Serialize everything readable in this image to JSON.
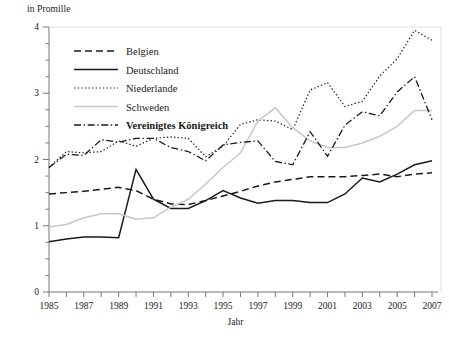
{
  "chart_data": {
    "type": "line",
    "title": "",
    "ylabel": "in Promille",
    "xlabel": "Jahr",
    "ylim": [
      0,
      4
    ],
    "ytick_labels": [
      "0",
      "1",
      "2",
      "3",
      "4"
    ],
    "ytick_values": [
      0,
      1,
      2,
      3,
      4
    ],
    "yminor_step": 0.25,
    "grid": false,
    "legend_position": "upper-left-inside",
    "xlim": [
      1985,
      2007
    ],
    "x": [
      1985,
      1986,
      1987,
      1988,
      1989,
      1990,
      1991,
      1992,
      1993,
      1994,
      1995,
      1996,
      1997,
      1998,
      1999,
      2000,
      2001,
      2002,
      2003,
      2004,
      2005,
      2006,
      2007
    ],
    "xtick_values": [
      1985,
      1986,
      1987,
      1988,
      1989,
      1990,
      1991,
      1992,
      1993,
      1994,
      1995,
      1996,
      1997,
      1998,
      1999,
      2000,
      2001,
      2002,
      2003,
      2004,
      2005,
      2006,
      2007
    ],
    "xtick_labels": [
      "1985",
      "",
      "1987",
      "",
      "1989",
      "",
      "1991",
      "",
      "1993",
      "",
      "1995",
      "",
      "1997",
      "",
      "1999",
      "",
      "2001",
      "",
      "2003",
      "",
      "2005",
      "",
      "2007"
    ],
    "series": [
      {
        "name": "Belgien",
        "style": "dashed",
        "color": "#1a1a1a",
        "values": [
          1.48,
          1.5,
          1.52,
          1.55,
          1.58,
          1.53,
          1.4,
          1.33,
          1.32,
          1.38,
          1.45,
          1.52,
          1.6,
          1.66,
          1.7,
          1.74,
          1.74,
          1.74,
          1.76,
          1.78,
          1.74,
          1.78,
          1.8
        ]
      },
      {
        "name": "Deutschland",
        "style": "solid",
        "color": "#1a1a1a",
        "values": [
          0.76,
          0.8,
          0.83,
          0.83,
          0.82,
          1.85,
          1.4,
          1.26,
          1.26,
          1.38,
          1.53,
          1.42,
          1.34,
          1.38,
          1.38,
          1.35,
          1.35,
          1.48,
          1.72,
          1.66,
          1.78,
          1.92,
          1.98
        ]
      },
      {
        "name": "Niederlande",
        "style": "dotted",
        "color": "#1a1a1a",
        "values": [
          1.88,
          2.12,
          2.1,
          2.12,
          2.28,
          2.2,
          2.32,
          2.34,
          2.32,
          2.04,
          2.2,
          2.53,
          2.6,
          2.58,
          2.45,
          3.05,
          3.16,
          2.8,
          2.88,
          3.26,
          3.52,
          3.95,
          3.8
        ]
      },
      {
        "name": "Schweden",
        "style": "solid-light",
        "color": "#c8c8c8",
        "values": [
          0.98,
          1.02,
          1.12,
          1.18,
          1.18,
          1.1,
          1.12,
          1.28,
          1.4,
          1.63,
          1.88,
          2.1,
          2.58,
          2.78,
          2.48,
          2.28,
          2.18,
          2.18,
          2.25,
          2.35,
          2.5,
          2.74,
          2.74
        ]
      },
      {
        "name": "Vereinigtes Königreich",
        "style": "dashdot",
        "color": "#1a1a1a",
        "values": [
          1.88,
          2.08,
          2.06,
          2.3,
          2.26,
          2.32,
          2.32,
          2.18,
          2.12,
          1.98,
          2.22,
          2.26,
          2.28,
          1.97,
          1.92,
          2.42,
          2.05,
          2.52,
          2.72,
          2.66,
          3.02,
          3.25,
          2.6
        ]
      }
    ]
  },
  "legend": {
    "items": [
      {
        "label": "Belgien",
        "bold": false
      },
      {
        "label": "Deutschland",
        "bold": false
      },
      {
        "label": "Niederlande",
        "bold": false
      },
      {
        "label": "Schweden",
        "bold": false
      },
      {
        "label": "Vereinigtes Königreich",
        "bold": true
      }
    ]
  }
}
